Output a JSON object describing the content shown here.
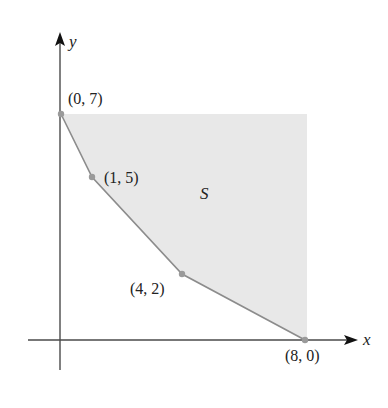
{
  "figure": {
    "axes": {
      "x_label": "x",
      "y_label": "y"
    },
    "region": {
      "label": "S",
      "description": "unbounded region above the polygonal boundary"
    },
    "points": [
      {
        "label": "(0, 7)",
        "x": 0,
        "y": 7
      },
      {
        "label": "(1, 5)",
        "x": 1,
        "y": 5
      },
      {
        "label": "(4, 2)",
        "x": 4,
        "y": 2
      },
      {
        "label": "(8, 0)",
        "x": 8,
        "y": 0
      }
    ],
    "colors": {
      "shading": "#e8e8e8",
      "boundary": "#8c8c8c",
      "axes": "#4a4a4a",
      "points": "#9a9a9a"
    }
  }
}
